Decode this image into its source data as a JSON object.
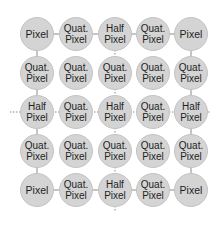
{
  "diagram": {
    "title": "",
    "grid": {
      "columns_x": [
        37,
        76,
        115,
        153,
        191
      ],
      "rows_y": [
        34,
        73,
        112,
        151,
        190
      ],
      "radius": 17
    },
    "colors": {
      "node_fill": "#d4d4d4",
      "node_border": "#c4c4c4",
      "line": "#888888",
      "text": "#1e1e1e"
    },
    "nodes": [
      [
        {
          "line1": "Pixel",
          "line2": ""
        },
        {
          "line1": "Quat.",
          "line2": "Pixel"
        },
        {
          "line1": "Half",
          "line2": "Pixel"
        },
        {
          "line1": "Quat.",
          "line2": "Pixel"
        },
        {
          "line1": "Pixel",
          "line2": ""
        }
      ],
      [
        {
          "line1": "Quat.",
          "line2": "Pixel"
        },
        {
          "line1": "Quat.",
          "line2": "Pixel"
        },
        {
          "line1": "Quat.",
          "line2": "Pixel"
        },
        {
          "line1": "Quat.",
          "line2": "Pixel"
        },
        {
          "line1": "Quat.",
          "line2": "Pixel"
        }
      ],
      [
        {
          "line1": "Half",
          "line2": "Pixel"
        },
        {
          "line1": "Quat.",
          "line2": "Pixel"
        },
        {
          "line1": "Half",
          "line2": "Pixel"
        },
        {
          "line1": "Quat.",
          "line2": "Pixel"
        },
        {
          "line1": "Half",
          "line2": "Pixel"
        }
      ],
      [
        {
          "line1": "Quat.",
          "line2": "Pixel"
        },
        {
          "line1": "Quat.",
          "line2": "Pixel"
        },
        {
          "line1": "Quat.",
          "line2": "Pixel"
        },
        {
          "line1": "Quat.",
          "line2": "Pixel"
        },
        {
          "line1": "Quat.",
          "line2": "Pixel"
        }
      ],
      [
        {
          "line1": "Pixel",
          "line2": ""
        },
        {
          "line1": "Quat.",
          "line2": "Pixel"
        },
        {
          "line1": "Half",
          "line2": "Pixel"
        },
        {
          "line1": "Quat.",
          "line2": "Pixel"
        },
        {
          "line1": "Pixel",
          "line2": ""
        }
      ]
    ]
  }
}
